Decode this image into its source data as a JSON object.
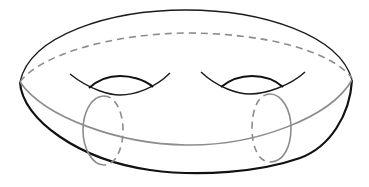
{
  "diagram": {
    "colors": {
      "background": "#ffffff",
      "outline": "#1a1a1a",
      "curves": "#8c8c8c"
    },
    "elements": [
      {
        "name": "outer-silhouette",
        "style": "solid black"
      },
      {
        "name": "back-equator",
        "style": "dashed gray"
      },
      {
        "name": "front-equator",
        "style": "solid gray"
      },
      {
        "name": "left-hole",
        "style": "solid black"
      },
      {
        "name": "right-hole",
        "style": "solid black"
      },
      {
        "name": "left-meridian",
        "style": "gray, half solid / half dashed"
      },
      {
        "name": "right-meridian",
        "style": "gray, half solid / half dashed"
      }
    ]
  }
}
